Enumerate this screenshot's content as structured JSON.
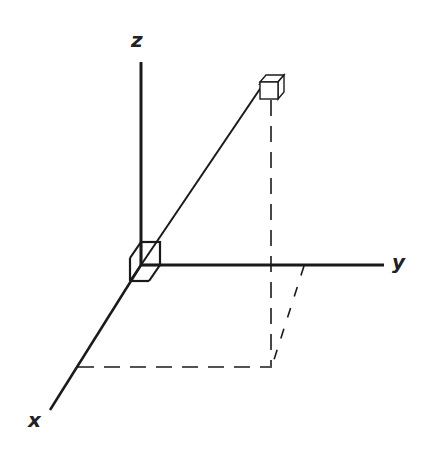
{
  "diagram": {
    "type": "3d-coordinate-axes",
    "axes": {
      "x": {
        "label": "x"
      },
      "y": {
        "label": "y"
      },
      "z": {
        "label": "z"
      }
    },
    "elements": {
      "origin_cube": "cube at origin",
      "target_cube": "small cube at end of position vector",
      "position_vector": "arrow from origin to target cube",
      "projection_lines": "dashed projection lines onto xy-plane"
    },
    "colors": {
      "ink": "#1a1a1a",
      "background": "#ffffff"
    }
  }
}
